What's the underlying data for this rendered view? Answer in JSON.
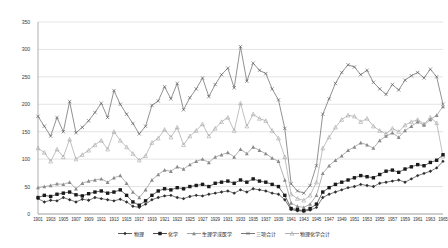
{
  "chart_data": {
    "type": "line",
    "title": "",
    "subtitle": "",
    "xlabel": "",
    "ylabel": "",
    "xlim": [
      1901,
      1965
    ],
    "ylim": [
      0,
      350
    ],
    "yticks": [
      0,
      50,
      100,
      150,
      200,
      250,
      300,
      350
    ],
    "grid": true,
    "legend_position": "bottom",
    "x": [
      1901,
      1902,
      1903,
      1904,
      1905,
      1906,
      1907,
      1908,
      1909,
      1910,
      1911,
      1912,
      1913,
      1914,
      1915,
      1916,
      1917,
      1918,
      1919,
      1920,
      1921,
      1922,
      1923,
      1924,
      1925,
      1926,
      1927,
      1928,
      1929,
      1930,
      1931,
      1932,
      1933,
      1934,
      1935,
      1936,
      1937,
      1938,
      1939,
      1940,
      1941,
      1942,
      1943,
      1944,
      1945,
      1946,
      1947,
      1948,
      1949,
      1950,
      1951,
      1952,
      1953,
      1954,
      1955,
      1956,
      1957,
      1958,
      1959,
      1960,
      1961,
      1962,
      1963,
      1964,
      1965
    ],
    "xtick_labels": [
      "1901",
      "1903",
      "1905",
      "1907",
      "1909",
      "1911",
      "1913",
      "1915",
      "1917",
      "1919",
      "1921",
      "1923",
      "1925",
      "1927",
      "1929",
      "1931",
      "1933",
      "1935",
      "1937",
      "1939",
      "1941",
      "1943",
      "1945",
      "1947",
      "1949",
      "1951",
      "1953",
      "1955",
      "1957",
      "1959",
      "1961",
      "1963",
      "1965"
    ],
    "xtick_values": [
      1901,
      1903,
      1905,
      1907,
      1909,
      1911,
      1913,
      1915,
      1917,
      1919,
      1921,
      1923,
      1925,
      1927,
      1929,
      1931,
      1933,
      1935,
      1937,
      1939,
      1941,
      1943,
      1945,
      1947,
      1949,
      1951,
      1953,
      1955,
      1957,
      1959,
      1961,
      1963,
      1965
    ],
    "series": [
      {
        "name": "物理",
        "color": "#2f2f2f",
        "marker": "diamond",
        "values": [
          28,
          22,
          25,
          24,
          30,
          26,
          22,
          27,
          25,
          30,
          28,
          26,
          24,
          27,
          22,
          14,
          12,
          18,
          26,
          30,
          33,
          34,
          30,
          28,
          32,
          34,
          33,
          36,
          38,
          40,
          42,
          38,
          44,
          40,
          46,
          44,
          42,
          38,
          36,
          26,
          8,
          6,
          5,
          7,
          12,
          30,
          36,
          40,
          44,
          48,
          50,
          54,
          52,
          50,
          56,
          58,
          60,
          62,
          58,
          64,
          70,
          74,
          78,
          84,
          96
        ]
      },
      {
        "name": "化学",
        "color": "#1a1a1a",
        "marker": "square",
        "values": [
          30,
          34,
          32,
          36,
          38,
          40,
          35,
          33,
          37,
          40,
          42,
          38,
          40,
          44,
          34,
          22,
          16,
          24,
          34,
          42,
          46,
          44,
          48,
          46,
          50,
          52,
          54,
          50,
          56,
          58,
          60,
          56,
          62,
          58,
          64,
          60,
          58,
          54,
          50,
          34,
          10,
          8,
          6,
          10,
          18,
          40,
          48,
          54,
          58,
          62,
          66,
          70,
          68,
          66,
          72,
          78,
          80,
          76,
          82,
          86,
          90,
          88,
          94,
          98,
          108
        ]
      },
      {
        "name": "生理学或医学",
        "color": "#8a8a8a",
        "marker": "triangle",
        "values": [
          48,
          50,
          52,
          55,
          54,
          58,
          46,
          56,
          60,
          62,
          64,
          58,
          66,
          70,
          56,
          40,
          30,
          44,
          62,
          72,
          80,
          78,
          86,
          82,
          90,
          96,
          100,
          94,
          104,
          108,
          112,
          104,
          118,
          110,
          122,
          116,
          110,
          102,
          96,
          62,
          20,
          14,
          12,
          18,
          34,
          74,
          88,
          98,
          106,
          116,
          122,
          130,
          126,
          120,
          134,
          142,
          148,
          140,
          152,
          160,
          168,
          162,
          172,
          180,
          196
        ]
      },
      {
        "name": "三项合计",
        "color": "#565656",
        "marker": "cross",
        "values": [
          178,
          160,
          142,
          176,
          150,
          205,
          148,
          158,
          170,
          185,
          202,
          176,
          225,
          200,
          182,
          165,
          146,
          160,
          198,
          206,
          232,
          210,
          238,
          190,
          212,
          228,
          248,
          214,
          236,
          254,
          266,
          230,
          305,
          242,
          275,
          262,
          256,
          228,
          208,
          156,
          55,
          42,
          38,
          52,
          88,
          182,
          210,
          238,
          258,
          272,
          268,
          254,
          262,
          240,
          228,
          218,
          236,
          226,
          244,
          252,
          258,
          248,
          264,
          250,
          200
        ]
      },
      {
        "name": "物理化学合计",
        "color": "#9d9d9d",
        "marker": "triangle-open",
        "values": [
          120,
          112,
          96,
          118,
          104,
          136,
          100,
          108,
          116,
          126,
          134,
          118,
          150,
          134,
          122,
          110,
          98,
          106,
          130,
          138,
          154,
          140,
          158,
          126,
          142,
          152,
          164,
          142,
          156,
          168,
          176,
          152,
          202,
          160,
          182,
          174,
          170,
          152,
          138,
          104,
          36,
          28,
          25,
          34,
          58,
          120,
          140,
          158,
          172,
          180,
          178,
          168,
          174,
          160,
          152,
          146,
          156,
          150,
          162,
          168,
          172,
          164,
          176,
          166,
          105
        ]
      }
    ]
  }
}
